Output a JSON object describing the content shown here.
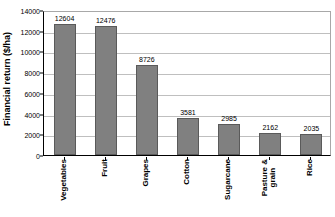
{
  "chart_data": {
    "type": "bar",
    "title": "",
    "xlabel": "",
    "ylabel": "Financial return ($/ha)",
    "ylim": [
      0,
      14000
    ],
    "ytick_labels": [
      "0",
      "2000",
      "4000",
      "6000",
      "8000",
      "10000",
      "12000",
      "14000"
    ],
    "ytick_values": [
      0,
      2000,
      4000,
      6000,
      8000,
      10000,
      12000,
      14000
    ],
    "grid": true,
    "legend": "none",
    "categories": [
      "Vegetables",
      "Fruit",
      "Grapes",
      "Cotton",
      "Sugarcane",
      "Pasture & grain",
      "Rice"
    ],
    "category_lines": [
      [
        "Vegetables"
      ],
      [
        "Fruit"
      ],
      [
        "Grapes"
      ],
      [
        "Cotton"
      ],
      [
        "Sugarcane"
      ],
      [
        "Pasture &",
        "grain"
      ],
      [
        "Rice"
      ]
    ],
    "values": [
      12604,
      12476,
      8726,
      3581,
      2985,
      2162,
      2035
    ],
    "value_labels": [
      "12604",
      "12476",
      "8726",
      "3581",
      "2985",
      "2162",
      "2035"
    ],
    "bar_color": "#808080",
    "bar_border_color": "#5a5a5a",
    "gridline_color": "#bfbfbf",
    "axis_color": "#000000",
    "background": "#ffffff"
  }
}
